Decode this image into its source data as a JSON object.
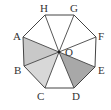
{
  "diagram": {
    "type": "regular-octagon",
    "center": {
      "label": "O",
      "x": 59,
      "y": 52
    },
    "vertices": [
      {
        "label": "A",
        "x": 23,
        "y": 37
      },
      {
        "label": "H",
        "x": 45,
        "y": 15
      },
      {
        "label": "G",
        "x": 74,
        "y": 15
      },
      {
        "label": "F",
        "x": 96,
        "y": 37
      },
      {
        "label": "E",
        "x": 95,
        "y": 67
      },
      {
        "label": "D",
        "x": 74,
        "y": 88
      },
      {
        "label": "C",
        "x": 45,
        "y": 88
      },
      {
        "label": "B",
        "x": 24,
        "y": 66
      }
    ],
    "shaded_triangles": [
      {
        "name": "AOB",
        "fill": "#c8c8c8"
      },
      {
        "name": "BOC",
        "fill": "#d8d8d8"
      },
      {
        "name": "DOE",
        "fill": "#a8a8a8"
      }
    ],
    "labels": {
      "A": "A",
      "B": "B",
      "C": "C",
      "D": "D",
      "E": "E",
      "F": "F",
      "G": "G",
      "H": "H",
      "O": "O"
    },
    "stroke_color": "#444444"
  }
}
